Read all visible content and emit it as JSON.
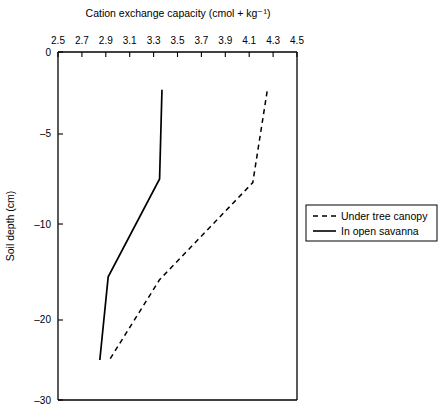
{
  "chart_data": {
    "type": "line",
    "title": "Cation exchange capacity (cmol + kg⁻¹)",
    "xlabel": "Cation exchange capacity (cmol + kg⁻¹)",
    "ylabel": "Soil depth (cm)",
    "xlim": [
      2.5,
      4.5
    ],
    "ylim": [
      -30,
      0
    ],
    "x_axis_position": "top",
    "grid": false,
    "legend_position": "right",
    "xticks": [
      2.5,
      2.7,
      2.9,
      3.1,
      3.3,
      3.5,
      3.7,
      3.9,
      4.1,
      4.3,
      4.5
    ],
    "xtick_labels": [
      "2.5",
      "2.7",
      "2.9",
      "3.1",
      "3.3",
      "3.5",
      "3.7",
      "3.9",
      "4.1",
      "4.3",
      "4.5"
    ],
    "yticks": [
      0,
      -5,
      -10,
      -20,
      -30
    ],
    "ytick_labels": [
      "0",
      "–5",
      "–10",
      "–20",
      "–30"
    ],
    "ytick_pixel_fractions": [
      0.0,
      0.2356,
      0.4943,
      0.7701,
      1.0
    ],
    "series": [
      {
        "name": "Under tree canopy",
        "style": "dashed",
        "color": "#000000",
        "points": [
          {
            "x": 4.25,
            "y": -2.4
          },
          {
            "x": 4.13,
            "y": -7.7
          },
          {
            "x": 3.35,
            "y": -15.8
          },
          {
            "x": 2.93,
            "y": -25.0
          }
        ]
      },
      {
        "name": "In open savanna",
        "style": "solid",
        "color": "#000000",
        "points": [
          {
            "x": 3.37,
            "y": -2.3
          },
          {
            "x": 3.35,
            "y": -7.5
          },
          {
            "x": 2.92,
            "y": -15.5
          },
          {
            "x": 2.85,
            "y": -25.0
          }
        ]
      }
    ]
  },
  "legend": {
    "items": [
      {
        "label": "Under tree canopy",
        "style": "dashed"
      },
      {
        "label": "In open savanna",
        "style": "solid"
      }
    ]
  }
}
